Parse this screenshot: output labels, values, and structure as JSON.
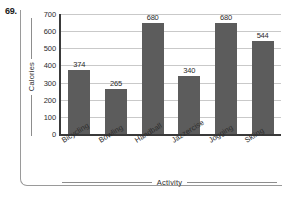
{
  "problem": {
    "number": "69."
  },
  "chart_data": {
    "type": "bar",
    "title": "",
    "xlabel": "Activity",
    "ylabel": "Calories",
    "categories": [
      "Bicycling",
      "Bowling",
      "Handball",
      "Jazzercise",
      "Jogging",
      "Skiing"
    ],
    "values": [
      374,
      265,
      680,
      340,
      680,
      544
    ],
    "ylim": [
      0,
      700
    ],
    "yticks": [
      0,
      100,
      200,
      300,
      400,
      500,
      600,
      700
    ],
    "ytick_labels": [
      "0",
      "100",
      "200",
      "300",
      "400",
      "500",
      "600",
      "700"
    ],
    "data_labels": [
      "374",
      "265",
      "680",
      "340",
      "680",
      "544"
    ],
    "grid": true,
    "grid_axis": "y",
    "legend": false,
    "bar_color": "#5c5c5c",
    "grid_color": "#c9c9c9",
    "axis_color": "#3a3a3a",
    "text_color": "#2b2b2b"
  }
}
